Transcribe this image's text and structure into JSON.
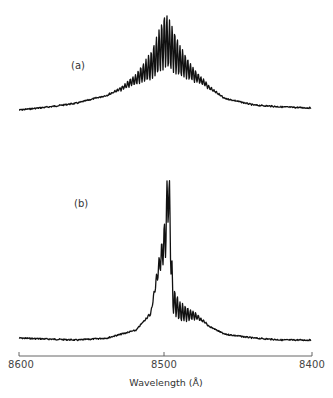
{
  "chart_data": {
    "type": "line",
    "title": "",
    "xlabel": "Wavelength (Å)",
    "ylabel": "",
    "xlim": [
      8600,
      8400
    ],
    "x_ticks": [
      "8600",
      "8500",
      "8400"
    ],
    "grid": false,
    "legend": null,
    "annotations": [
      "(a)",
      "(b)"
    ],
    "series": [
      {
        "name": "(a)",
        "description": "Broad symmetric band centered near 8500 Å with dense regular ripple modulation near the peak",
        "x": [
          8600,
          8580,
          8560,
          8540,
          8530,
          8520,
          8510,
          8505,
          8500,
          8495,
          8490,
          8480,
          8470,
          8460,
          8440,
          8420,
          8400
        ],
        "y_relative": [
          0.02,
          0.05,
          0.09,
          0.17,
          0.25,
          0.38,
          0.6,
          0.8,
          1.0,
          0.85,
          0.66,
          0.42,
          0.26,
          0.14,
          0.07,
          0.05,
          0.04
        ]
      },
      {
        "name": "(b)",
        "description": "Narrow dominant spike near 8498 Å with several lower sharp peaks on the long-wavelength side and a modulated shoulder",
        "x": [
          8600,
          8560,
          8540,
          8520,
          8510,
          8505,
          8502,
          8500,
          8498,
          8495,
          8490,
          8480,
          8470,
          8460,
          8440,
          8420,
          8400
        ],
        "y_relative": [
          0.04,
          0.03,
          0.04,
          0.08,
          0.17,
          0.42,
          0.55,
          0.66,
          1.0,
          0.3,
          0.22,
          0.17,
          0.1,
          0.06,
          0.04,
          0.03,
          0.03
        ]
      }
    ]
  },
  "labels": {
    "a": "(a)",
    "b": "(b)",
    "tick_left": "8600",
    "tick_mid": "8500",
    "tick_right": "8400",
    "xlabel": "Wavelength (Å)"
  }
}
